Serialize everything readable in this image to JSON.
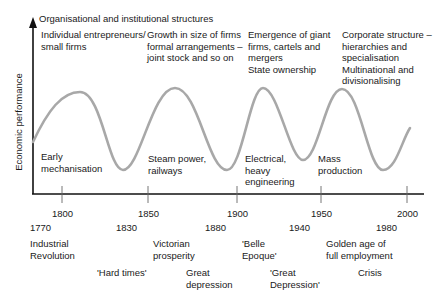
{
  "header": {
    "title": "Organisational and institutional structures"
  },
  "structures": [
    {
      "text": "Individual entrepreneurs/\nsmall firms"
    },
    {
      "text": "Growth in size of firms\nformal arrangements –\njoint stock and so on"
    },
    {
      "text": "Emergence of giant\nfirms, cartels and\nmergers\nState ownership"
    },
    {
      "text": "Corporate structure –\nhierarchies and\nspecialisation\nMultinational and\ndivisionalising"
    }
  ],
  "y_axis": {
    "label": "Economic performance"
  },
  "technologies": [
    {
      "text": "Early\nmechanisation"
    },
    {
      "text": "Steam power,\nrailways"
    },
    {
      "text": "Electrical,\nheavy\nengineering"
    },
    {
      "text": "Mass\nproduction"
    }
  ],
  "x_axis": {
    "major_ticks": [
      "1800",
      "1850",
      "1900",
      "1950",
      "2000"
    ],
    "phase_years": [
      "1770",
      "1830",
      "1880",
      "1940",
      "1980"
    ]
  },
  "upswing_labels": [
    {
      "text": "Industrial\nRevolution"
    },
    {
      "text": "Victorian\nprosperity"
    },
    {
      "text": "'Belle\nEpoque'"
    },
    {
      "text": "Golden age of\nfull employment"
    }
  ],
  "downswing_labels": [
    {
      "text": "'Hard times'"
    },
    {
      "text": "Great\ndepression"
    },
    {
      "text": "'Great\nDepression'"
    },
    {
      "text": "Crisis"
    }
  ],
  "colors": {
    "curve": "#a8a8a8",
    "axis": "#111111",
    "tick": "#666666",
    "text": "#1a1a1a"
  }
}
